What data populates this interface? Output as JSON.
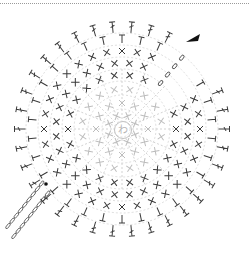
{
  "diagram": {
    "type": "crochet-chart",
    "center_symbol": "わ",
    "center_meaning": "magic ring",
    "colors": {
      "ink": "#3a3a3a",
      "light_ink": "#bdbdbd",
      "dashed_ink": "#c8c8c8",
      "border": "#9a9a9a"
    },
    "center": {
      "x": 122,
      "y": 129
    },
    "rounds": [
      {
        "index": 1,
        "radius": 14,
        "stitch": "sc",
        "count": 8,
        "tone": "light"
      },
      {
        "index": 2,
        "radius": 26,
        "stitch": "sc",
        "count": 12,
        "tone": "light"
      },
      {
        "index": 3,
        "radius": 40,
        "stitch": "sc",
        "count": 16,
        "tone": "light"
      },
      {
        "index": 4,
        "radius": 54,
        "stitch": "sc",
        "count": 22,
        "tone": "dark"
      },
      {
        "index": 5,
        "radius": 66,
        "stitch": "sc",
        "count": 28,
        "tone": "dark"
      },
      {
        "index": 6,
        "radius": 78,
        "stitch": "sc",
        "count": 32,
        "tone": "dark"
      },
      {
        "index": 7,
        "radius": 90,
        "stitch": "hdc",
        "count": 30,
        "tone": "dark"
      },
      {
        "index": 8,
        "radius": 102,
        "stitch": "dc",
        "count": 34,
        "tone": "dark"
      }
    ],
    "gap": {
      "from_deg": -60,
      "to_deg": -30
    },
    "start_arrow": {
      "x": 200,
      "y": 37,
      "angle_deg": -25
    },
    "chain_loop": {
      "x": 43,
      "y": 211
    },
    "decorative_border": "dotted-top"
  }
}
